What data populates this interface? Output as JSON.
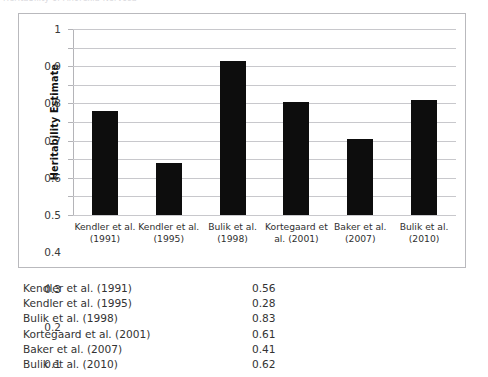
{
  "page": {
    "cutoff_header_text": "Heritability of Anorexia Nervosa"
  },
  "chart_data": {
    "type": "bar",
    "title": "",
    "xlabel": "",
    "ylabel": "Heritability Estimate",
    "categories": [
      "Kendler et al. (1991)",
      "Kendler et al. (1995)",
      "Bulik et al. (1998)",
      "Kortegaard et al. (2001)",
      "Baker et al. (2007)",
      "Bulik et al. (2010)"
    ],
    "category_lines": [
      [
        "Kendler et al.",
        "(1991)"
      ],
      [
        "Kendler et al.",
        "(1995)"
      ],
      [
        "Bulik et al.",
        "(1998)"
      ],
      [
        "Kortegaard et",
        "al. (2001)"
      ],
      [
        "Baker et al.",
        "(2007)"
      ],
      [
        "Bulik et al.",
        "(2010)"
      ]
    ],
    "values": [
      0.56,
      0.28,
      0.83,
      0.61,
      0.41,
      0.62
    ],
    "ylim": [
      0,
      1
    ],
    "ytick_labels": [
      "1",
      "0.9",
      "0.8",
      "0.7",
      "0.6",
      "0.5",
      "0.4",
      "0.3",
      "0.2",
      "0.1",
      "0"
    ],
    "ytick_values": [
      1,
      0.9,
      0.8,
      0.7,
      0.6,
      0.5,
      0.4,
      0.3,
      0.2,
      0.1,
      0
    ],
    "grid": true,
    "legend": "none",
    "bar_color": "#0d0d0d",
    "gridline_color": "#c8c8cc"
  },
  "table": {
    "rows": [
      {
        "label": "Kendler et al. (1991)",
        "value": "0.56"
      },
      {
        "label": "Kendler et al. (1995)",
        "value": "0.28"
      },
      {
        "label": "Bulik et al. (1998)",
        "value": "0.83"
      },
      {
        "label": "Kortegaard et al. (2001)",
        "value": "0.61"
      },
      {
        "label": "Baker et al. (2007)",
        "value": "0.41"
      },
      {
        "label": "Bulik et al. (2010)",
        "value": "0.62"
      }
    ]
  }
}
